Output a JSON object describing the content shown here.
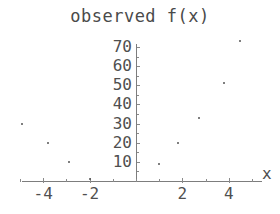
{
  "chart_data": {
    "type": "scatter",
    "title": "observed f(x)",
    "xlabel": "x",
    "ylabel": "",
    "xlim": [
      -5.6,
      5.4
    ],
    "ylim": [
      0,
      76
    ],
    "grid": false,
    "legend": null,
    "x_ticks": [
      -4,
      -2,
      2,
      4
    ],
    "x_tick_labels": [
      "-4",
      "-2",
      "2",
      "4"
    ],
    "x_minor_ticks": [
      -5,
      -3,
      -1,
      0,
      1,
      3,
      5
    ],
    "y_ticks": [
      10,
      20,
      30,
      40,
      50,
      60,
      70
    ],
    "y_tick_labels": [
      "10",
      "20",
      "30",
      "40",
      "50",
      "60",
      "70"
    ],
    "points": [
      {
        "x": -4.9,
        "y": 30
      },
      {
        "x": -3.8,
        "y": 20
      },
      {
        "x": -2.9,
        "y": 10
      },
      {
        "x": -2.0,
        "y": 1
      },
      {
        "x": 1.0,
        "y": 9
      },
      {
        "x": 1.8,
        "y": 20
      },
      {
        "x": 2.7,
        "y": 33
      },
      {
        "x": 3.8,
        "y": 51
      },
      {
        "x": 4.5,
        "y": 73
      }
    ],
    "marker_color": "#555555",
    "axis_color": "#7d7d7d",
    "text_color": "#4f4f4f"
  }
}
